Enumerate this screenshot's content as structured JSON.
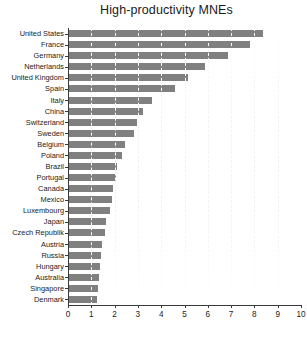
{
  "chart_data": {
    "type": "bar",
    "orientation": "horizontal",
    "title": "High-productivity MNEs",
    "xlabel": "",
    "ylabel": "",
    "xlim": [
      0,
      10
    ],
    "ylim": [
      0,
      25
    ],
    "xticks": [
      "0",
      "1",
      "2",
      "3",
      "4",
      "5",
      "6",
      "7",
      "8",
      "9",
      "10"
    ],
    "grid": true,
    "grid_axis": "x",
    "grid_style": "dashed",
    "legend": false,
    "bar_color": "#808080",
    "categories": [
      "United States",
      "France",
      "Germany",
      "Netherlands",
      "United Kingdom",
      "Spain",
      "Italy",
      "China",
      "Switzerland",
      "Sweden",
      "Belgium",
      "Poland",
      "Brazil",
      "Portugal",
      "Canada",
      "Mexico",
      "Luxembourg",
      "Japan",
      "Czech Republik",
      "Austria",
      "Russia",
      "Hungary",
      "Australia",
      "Singapore",
      "Denmark"
    ],
    "values": [
      8.35,
      7.8,
      6.85,
      5.9,
      5.15,
      4.6,
      3.6,
      3.2,
      2.95,
      2.85,
      2.45,
      2.3,
      2.1,
      2.05,
      1.95,
      1.9,
      1.8,
      1.62,
      1.58,
      1.45,
      1.42,
      1.38,
      1.33,
      1.3,
      1.25
    ]
  }
}
